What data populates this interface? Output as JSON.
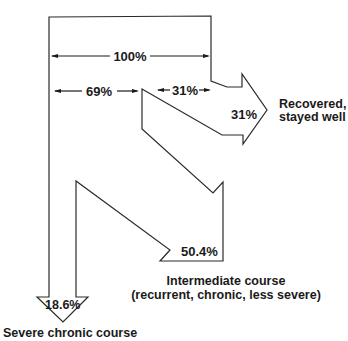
{
  "diagram": {
    "type": "flow",
    "dimensions": {
      "total": "100%",
      "split_left": "69%",
      "split_right": "31%"
    },
    "outcomes": [
      {
        "id": "recovered",
        "value": "31%",
        "label_line1": "Recovered,",
        "label_line2": "stayed well"
      },
      {
        "id": "intermediate",
        "value": "50.4%",
        "label_line1": "Intermediate course",
        "label_line2": "(recurrent, chronic, less severe)"
      },
      {
        "id": "severe",
        "value": "18.6%",
        "label_line1": "Severe chronic course"
      }
    ],
    "colors": {
      "stroke": "#2a2a2a",
      "fill": "#ffffff",
      "text": "#1a1a1a"
    }
  }
}
